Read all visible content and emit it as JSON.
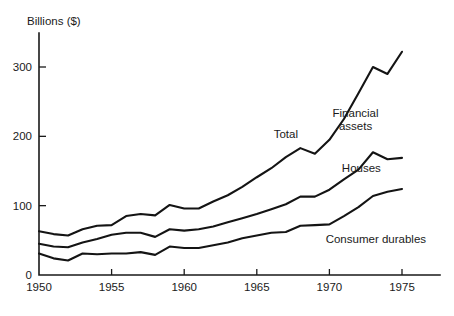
{
  "chart_data": {
    "type": "line",
    "title": "",
    "subtitle": "",
    "xlabel": "",
    "ylabel": "Billions ($)",
    "ylim": [
      0,
      340
    ],
    "xlim": [
      1950,
      1977.5
    ],
    "grid": false,
    "legend": "inline-annotations",
    "y_ticks": [
      0,
      100,
      200,
      300
    ],
    "y_tick_labels": [
      "0",
      "100",
      "200",
      "300"
    ],
    "x_ticks": [
      1950,
      1955,
      1960,
      1965,
      1970,
      1975
    ],
    "x_tick_labels": [
      "1950",
      "1955",
      "1960",
      "1965",
      "1970",
      "1975"
    ],
    "x": [
      1950,
      1951,
      1952,
      1953,
      1954,
      1955,
      1956,
      1957,
      1958,
      1959,
      1960,
      1961,
      1962,
      1963,
      1964,
      1965,
      1966,
      1967,
      1968,
      1969,
      1970,
      1971,
      1972,
      1973,
      1974,
      1975
    ],
    "series": [
      {
        "name": "Total",
        "label": "Total",
        "annotation": "Financial assets",
        "values": [
          63,
          59,
          57,
          66,
          71,
          72,
          85,
          88,
          86,
          101,
          96,
          96,
          106,
          115,
          127,
          141,
          154,
          170,
          183,
          175,
          195,
          225,
          262,
          300,
          290,
          322
        ]
      },
      {
        "name": "Houses",
        "label": "Houses",
        "values": [
          45,
          41,
          40,
          47,
          52,
          58,
          61,
          61,
          55,
          66,
          64,
          66,
          70,
          76,
          82,
          88,
          95,
          102,
          113,
          113,
          123,
          138,
          152,
          177,
          167,
          169
        ]
      },
      {
        "name": "Consumer durables",
        "label": "Consumer durables",
        "values": [
          31,
          24,
          21,
          31,
          30,
          31,
          31,
          33,
          29,
          41,
          39,
          39,
          43,
          47,
          53,
          57,
          61,
          62,
          71,
          72,
          73,
          85,
          98,
          114,
          120,
          124
        ]
      }
    ],
    "annotations": [
      {
        "text": "Total",
        "x": 1967,
        "y": 198
      },
      {
        "text": "Financial",
        "x": 1971.8,
        "y": 228
      },
      {
        "text": "assets",
        "x": 1971.8,
        "y": 209
      },
      {
        "text": "Houses",
        "x": 1972.2,
        "y": 149
      },
      {
        "text": "Consumer durables",
        "x": 1973.2,
        "y": 46
      }
    ],
    "colors": {
      "line": "#141414",
      "axis": "#1a1a1a",
      "background": "#ffffff",
      "text": "#1a1a1a"
    }
  }
}
